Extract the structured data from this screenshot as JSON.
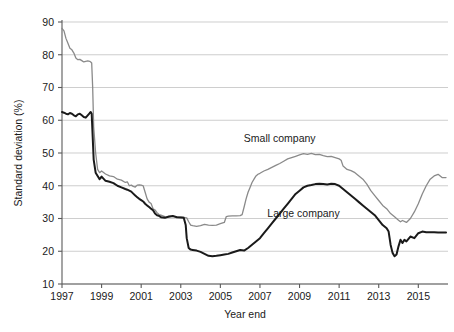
{
  "chart_data": {
    "type": "line",
    "title": "",
    "xlabel": "Year end",
    "ylabel": "Standard deviation (%)",
    "xlim": [
      1997,
      2016.5
    ],
    "ylim": [
      10,
      90
    ],
    "yticks": [
      10,
      20,
      30,
      40,
      50,
      60,
      70,
      80,
      90
    ],
    "xticks": [
      1997,
      1999,
      2001,
      2003,
      2005,
      2007,
      2009,
      2011,
      2013,
      2015
    ],
    "ytick_labels": [
      "10",
      "20",
      "30",
      "40",
      "50",
      "60",
      "70",
      "80",
      "90"
    ],
    "xtick_labels": [
      "1997",
      "1999",
      "2001",
      "2003",
      "2005",
      "2007",
      "2009",
      "2011",
      "2013",
      "2015"
    ],
    "grid": true,
    "grid_axis": "y",
    "legend_position": "inline-annotations",
    "series": [
      {
        "name": "Small company",
        "color": "#8a8a8a",
        "stroke_width": 1.3,
        "label_x": 2008.0,
        "label_y": 53.5,
        "x": [
          1997.0,
          1997.1,
          1997.2,
          1997.3,
          1997.4,
          1997.5,
          1997.6,
          1997.7,
          1997.8,
          1997.9,
          1998.0,
          1998.1,
          1998.2,
          1998.3,
          1998.4,
          1998.45,
          1998.5,
          1998.55,
          1998.6,
          1998.7,
          1998.8,
          1998.9,
          1999.0,
          1999.2,
          1999.4,
          1999.6,
          1999.8,
          2000.0,
          2000.2,
          2000.3,
          2000.4,
          2000.5,
          2000.6,
          2000.7,
          2000.8,
          2000.9,
          2001.0,
          2001.1,
          2001.2,
          2001.3,
          2001.4,
          2001.5,
          2001.6,
          2001.7,
          2001.8,
          2001.9,
          2002.0,
          2002.2,
          2002.4,
          2002.6,
          2002.8,
          2003.0,
          2003.2,
          2003.3,
          2003.4,
          2003.5,
          2003.6,
          2003.8,
          2004.0,
          2004.2,
          2004.4,
          2004.6,
          2004.8,
          2005.0,
          2005.2,
          2005.3,
          2005.4,
          2005.6,
          2005.8,
          2006.0,
          2006.1,
          2006.2,
          2006.3,
          2006.4,
          2006.5,
          2006.6,
          2006.7,
          2006.8,
          2006.9,
          2007.0,
          2007.2,
          2007.4,
          2007.6,
          2007.8,
          2008.0,
          2008.2,
          2008.4,
          2008.6,
          2008.8,
          2009.0,
          2009.2,
          2009.4,
          2009.6,
          2009.8,
          2010.0,
          2010.2,
          2010.4,
          2010.6,
          2010.8,
          2011.0,
          2011.1,
          2011.2,
          2011.4,
          2011.6,
          2011.8,
          2012.0,
          2012.2,
          2012.4,
          2012.6,
          2012.8,
          2013.0,
          2013.2,
          2013.4,
          2013.6,
          2013.8,
          2014.0,
          2014.1,
          2014.2,
          2014.4,
          2014.6,
          2014.8,
          2015.0,
          2015.2,
          2015.4,
          2015.6,
          2015.8,
          2016.0,
          2016.2,
          2016.4
        ],
        "y": [
          88.0,
          87.3,
          85.0,
          83.5,
          82.0,
          81.5,
          80.5,
          79.0,
          78.5,
          78.6,
          78.2,
          77.8,
          78.0,
          78.1,
          78.0,
          77.8,
          77.5,
          70.0,
          58.0,
          50.0,
          45.0,
          44.0,
          44.5,
          43.6,
          43.0,
          42.8,
          42.0,
          41.7,
          41.0,
          41.2,
          40.0,
          40.2,
          39.8,
          39.6,
          40.2,
          40.3,
          40.2,
          40.0,
          38.0,
          36.0,
          35.0,
          34.6,
          33.0,
          32.6,
          31.8,
          31.2,
          31.0,
          30.6,
          30.4,
          30.6,
          30.5,
          30.4,
          30.3,
          30.2,
          29.0,
          28.0,
          27.8,
          27.6,
          27.8,
          28.2,
          28.0,
          27.9,
          28.0,
          28.4,
          28.8,
          30.6,
          30.7,
          30.8,
          30.8,
          30.9,
          31.2,
          33.5,
          36.0,
          38.0,
          39.5,
          41.0,
          42.0,
          43.0,
          43.5,
          43.8,
          44.5,
          45.0,
          45.6,
          46.2,
          46.8,
          47.5,
          48.2,
          48.6,
          49.0,
          49.4,
          49.8,
          49.6,
          49.9,
          49.5,
          49.6,
          49.2,
          48.9,
          49.0,
          48.6,
          48.2,
          47.8,
          46.0,
          45.0,
          44.6,
          44.0,
          43.0,
          42.0,
          40.5,
          38.5,
          37.0,
          35.5,
          34.0,
          33.0,
          31.5,
          30.5,
          29.5,
          29.0,
          29.4,
          28.8,
          30.0,
          32.0,
          34.5,
          37.5,
          40.0,
          42.0,
          43.0,
          43.5,
          42.5,
          42.5
        ]
      },
      {
        "name": "Large company",
        "color": "#1a1a1a",
        "stroke_width": 2.0,
        "label_x": 2009.2,
        "label_y": 30.5,
        "x": [
          1997.0,
          1997.1,
          1997.2,
          1997.3,
          1997.4,
          1997.5,
          1997.6,
          1997.7,
          1997.8,
          1997.9,
          1998.0,
          1998.1,
          1998.2,
          1998.3,
          1998.4,
          1998.45,
          1998.5,
          1998.55,
          1998.6,
          1998.7,
          1998.8,
          1998.9,
          1999.0,
          1999.2,
          1999.4,
          1999.6,
          1999.8,
          2000.0,
          2000.2,
          2000.3,
          2000.4,
          2000.5,
          2000.6,
          2000.7,
          2000.8,
          2000.9,
          2001.0,
          2001.1,
          2001.2,
          2001.3,
          2001.4,
          2001.5,
          2001.6,
          2001.7,
          2001.8,
          2001.9,
          2002.0,
          2002.2,
          2002.4,
          2002.6,
          2002.8,
          2003.0,
          2003.15,
          2003.25,
          2003.3,
          2003.4,
          2003.5,
          2003.6,
          2003.8,
          2004.0,
          2004.2,
          2004.4,
          2004.6,
          2004.8,
          2005.0,
          2005.2,
          2005.4,
          2005.6,
          2005.8,
          2006.0,
          2006.2,
          2006.4,
          2006.6,
          2006.8,
          2007.0,
          2007.2,
          2007.4,
          2007.6,
          2007.8,
          2008.0,
          2008.2,
          2008.4,
          2008.6,
          2008.8,
          2009.0,
          2009.2,
          2009.4,
          2009.6,
          2009.8,
          2010.0,
          2010.2,
          2010.4,
          2010.6,
          2010.8,
          2011.0,
          2011.2,
          2011.4,
          2011.6,
          2011.8,
          2012.0,
          2012.2,
          2012.4,
          2012.6,
          2012.8,
          2013.0,
          2013.2,
          2013.4,
          2013.5,
          2013.6,
          2013.7,
          2013.8,
          2013.9,
          2014.0,
          2014.1,
          2014.2,
          2014.3,
          2014.4,
          2014.6,
          2014.8,
          2015.0,
          2015.2,
          2015.4,
          2015.6,
          2015.8,
          2016.0,
          2016.2,
          2016.4
        ],
        "y": [
          62.5,
          62.3,
          62.0,
          61.8,
          62.2,
          62.0,
          61.5,
          61.2,
          61.8,
          62.0,
          61.5,
          61.0,
          60.8,
          61.5,
          62.2,
          62.5,
          62.0,
          55.0,
          48.0,
          44.0,
          43.0,
          42.0,
          42.8,
          41.5,
          41.2,
          40.8,
          40.0,
          39.5,
          39.0,
          38.8,
          38.5,
          38.2,
          37.6,
          37.0,
          36.5,
          36.0,
          35.6,
          35.2,
          34.5,
          34.0,
          33.5,
          33.0,
          32.5,
          31.5,
          31.0,
          30.8,
          30.4,
          30.2,
          30.6,
          30.8,
          30.4,
          30.3,
          30.2,
          28.0,
          24.0,
          21.0,
          20.5,
          20.4,
          20.2,
          19.8,
          19.2,
          18.6,
          18.5,
          18.6,
          18.8,
          19.0,
          19.2,
          19.6,
          20.0,
          20.4,
          20.2,
          21.0,
          22.0,
          23.0,
          24.0,
          25.5,
          27.0,
          28.5,
          30.0,
          31.5,
          33.0,
          34.5,
          36.0,
          37.5,
          38.5,
          39.5,
          40.0,
          40.2,
          40.5,
          40.6,
          40.5,
          40.4,
          40.6,
          40.5,
          40.0,
          39.0,
          38.0,
          37.0,
          36.0,
          35.0,
          34.0,
          33.0,
          32.0,
          31.0,
          29.5,
          28.0,
          27.0,
          26.0,
          22.0,
          19.5,
          18.5,
          19.0,
          21.5,
          23.5,
          22.5,
          23.5,
          23.0,
          24.5,
          24.0,
          25.5,
          26.0,
          25.8,
          25.8,
          25.8,
          25.7,
          25.7,
          25.7
        ]
      }
    ]
  },
  "geometry": {
    "plot_left": 62,
    "plot_right": 448,
    "plot_top": 22,
    "plot_bottom": 284
  }
}
